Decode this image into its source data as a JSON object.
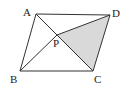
{
  "figure": {
    "type": "parallelogram-with-diagonals",
    "stroke_color": "#333333",
    "shade_color": "#d9d9d9",
    "points": {
      "A": {
        "label": "A",
        "x": 36,
        "y": 14,
        "lx": 23,
        "ly": 16
      },
      "D": {
        "label": "D",
        "x": 110,
        "y": 15,
        "lx": 112,
        "ly": 17
      },
      "B": {
        "label": "B",
        "x": 20,
        "y": 71,
        "lx": 10,
        "ly": 83
      },
      "C": {
        "label": "C",
        "x": 93,
        "y": 71,
        "lx": 94,
        "ly": 83
      },
      "P": {
        "label": "P",
        "x": 57,
        "y": 35,
        "lx": 53,
        "ly": 47
      }
    },
    "shaded_region": [
      "P",
      "D",
      "C"
    ]
  }
}
